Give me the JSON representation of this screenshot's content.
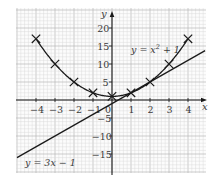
{
  "chart_data": {
    "type": "line",
    "title": "",
    "xlabel": "x",
    "ylabel": "y",
    "xlim": [
      -5,
      5
    ],
    "ylim": [
      -20,
      25
    ],
    "grid": true,
    "x_ticks": [
      -4,
      -3,
      -2,
      -1,
      0,
      1,
      2,
      3,
      4
    ],
    "x_tick_labels": [
      "−4",
      "−3",
      "−2",
      "−1",
      "0",
      "1",
      "2",
      "3",
      "4"
    ],
    "y_ticks": [
      -15,
      -10,
      -5,
      5,
      10,
      15,
      20
    ],
    "y_tick_labels": [
      "−15",
      "−10",
      "−5",
      "5",
      "10",
      "15",
      "20"
    ],
    "series": [
      {
        "name": "y = x² + 1",
        "kind": "curve",
        "marker": "cross",
        "x": [
          -4,
          -3,
          -2,
          -1,
          0,
          1,
          2,
          3,
          4
        ],
        "values": [
          17,
          10,
          5,
          2,
          1,
          2,
          5,
          10,
          17
        ]
      },
      {
        "name": "y = 3x − 1",
        "kind": "line",
        "marker": "none",
        "x": [
          -5,
          4.9
        ],
        "values": [
          -16,
          13.7
        ]
      }
    ],
    "annotations": [
      {
        "text": "y = x² + 1",
        "near": [
          3.0,
          13.5
        ]
      },
      {
        "text": "y = 3x − 1",
        "near": [
          -3.5,
          -15.5
        ]
      }
    ],
    "legend": "none"
  },
  "labels": {
    "x_axis": "x",
    "y_axis": "y",
    "curve_label_main": "y = x",
    "curve_label_sup": "2",
    "curve_label_tail": " + 1",
    "line_label": "y = 3x − 1"
  },
  "colors": {
    "ink": "#1a1a1a",
    "grid_minor": "#d9d9d9",
    "grid_major": "#b8b8b8",
    "text": "#3a3a3a"
  }
}
